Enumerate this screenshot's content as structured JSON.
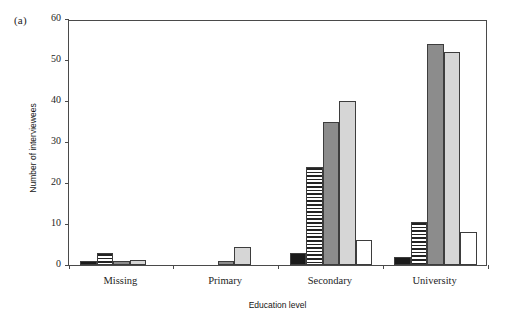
{
  "figure": {
    "panel_label": "(a)"
  },
  "chart_data": {
    "type": "bar",
    "title": "",
    "xlabel": "Education level",
    "ylabel": "Number of interviewees",
    "ylim": [
      0,
      60
    ],
    "yticks": [
      0,
      10,
      20,
      30,
      40,
      50,
      60
    ],
    "grid": false,
    "legend": "none",
    "categories": [
      "Missing",
      "Primary",
      "Secondary",
      "University"
    ],
    "series": [
      {
        "name": "Series 1",
        "fill": "black",
        "color": "#1a1a1a",
        "values": [
          1,
          0,
          3,
          2
        ]
      },
      {
        "name": "Series 2",
        "fill": "hstripe",
        "color": "#232323",
        "values": [
          3,
          0,
          24,
          10.5
        ]
      },
      {
        "name": "Series 3",
        "fill": "darkgray",
        "color": "#8c8c8c",
        "values": [
          1,
          1,
          35,
          54
        ]
      },
      {
        "name": "Series 4",
        "fill": "lightgray",
        "color": "#d6d6d6",
        "values": [
          1.2,
          4.5,
          40,
          52
        ]
      },
      {
        "name": "Series 5",
        "fill": "white",
        "color": "#ffffff",
        "values": [
          0,
          0,
          6,
          8
        ]
      }
    ]
  }
}
